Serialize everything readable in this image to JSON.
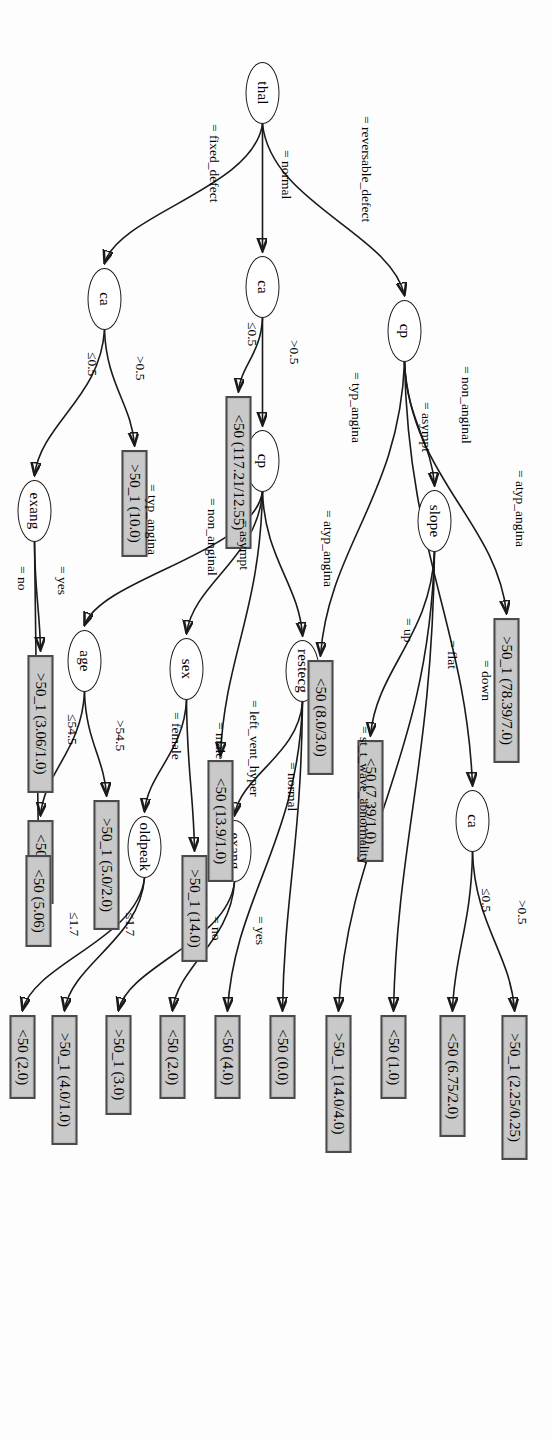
{
  "figure": {
    "kind": "decision-tree",
    "domain": "heart-disease (Cleveland) J48 / C4.5 pruned tree",
    "orientation": "rotated-90-clockwise",
    "root": "thal",
    "leaf_class_labels": [
      "<50",
      ">50_1"
    ]
  },
  "nodes": [
    {
      "id": "thal",
      "label": "thal",
      "type": "decision",
      "x": 62,
      "y": 272
    },
    {
      "id": "cp_top",
      "label": "cp",
      "type": "decision",
      "x": 300,
      "y": 130
    },
    {
      "id": "ca_mid",
      "label": "ca",
      "type": "decision",
      "x": 256,
      "y": 272
    },
    {
      "id": "ca_bot",
      "label": "ca",
      "type": "decision",
      "x": 268,
      "y": 430
    },
    {
      "id": "slope",
      "label": "slope",
      "type": "decision",
      "x": 490,
      "y": 100
    },
    {
      "id": "ca_top",
      "label": "ca",
      "type": "decision",
      "x": 790,
      "y": 62
    },
    {
      "id": "cp_mid",
      "label": "cp",
      "type": "decision",
      "x": 430,
      "y": 272
    },
    {
      "id": "restecg",
      "label": "restecg",
      "type": "decision",
      "x": 640,
      "y": 232
    },
    {
      "id": "exang_mid",
      "label": "exang",
      "type": "decision",
      "x": 820,
      "y": 300
    },
    {
      "id": "sex",
      "label": "sex",
      "type": "decision",
      "x": 638,
      "y": 348
    },
    {
      "id": "oldpeak",
      "label": "oldpeak",
      "type": "decision",
      "x": 816,
      "y": 390
    },
    {
      "id": "age",
      "label": "age",
      "type": "decision",
      "x": 630,
      "y": 450
    },
    {
      "id": "exang_bot",
      "label": "exang",
      "type": "decision",
      "x": 480,
      "y": 500
    }
  ],
  "leaves": [
    {
      "id": "L_ca_top_gt",
      "label": ">50_1 (2.25/0.25)",
      "x": 1015,
      "y": 24
    },
    {
      "id": "L_ca_top_le",
      "label": "<50 (6.75/2.0)",
      "x": 1015,
      "y": 86
    },
    {
      "id": "L_slope_down",
      "label": "<50 (1.0)",
      "x": 1015,
      "y": 145
    },
    {
      "id": "L_slope_flat",
      "label": ">50_1 (14.0/4.0)",
      "x": 1015,
      "y": 200
    },
    {
      "id": "L_slope_up",
      "label": "<50 (7.39/1.0)",
      "x": 740,
      "y": 168
    },
    {
      "id": "L_cp_asympt",
      "label": ">50_1 (78.39/7.0)",
      "x": 618,
      "y": 32
    },
    {
      "id": "L_cp_typ",
      "label": "<50 (8.0/3.0)",
      "x": 660,
      "y": 218
    },
    {
      "id": "L_rest_stt",
      "label": "<50 (0.0)",
      "x": 1015,
      "y": 256
    },
    {
      "id": "L_rest_norm",
      "label": "<50 (4.0)",
      "x": 1015,
      "y": 311
    },
    {
      "id": "L_exm_yes",
      "label": "<50 (2.0)",
      "x": 1015,
      "y": 366
    },
    {
      "id": "L_exm_no",
      "label": ">50_1 (3.0)",
      "x": 1015,
      "y": 420
    },
    {
      "id": "L_cpm_asym",
      "label": "<50 (13.9/1.0)",
      "x": 760,
      "y": 318
    },
    {
      "id": "L_sex_male",
      "label": ">50_1 (14.0)",
      "x": 855,
      "y": 344
    },
    {
      "id": "L_old_le",
      "label": ">50_1 (4.0/1.0)",
      "x": 1015,
      "y": 474
    },
    {
      "id": "L_old_gt",
      "label": "<50 (2.0)",
      "x": 1015,
      "y": 516
    },
    {
      "id": "L_ca_bot_gt",
      "label": ">50_1 (10.0)",
      "x": 450,
      "y": 404
    },
    {
      "id": "L_age_gt",
      "label": ">50_1 (5.0/2.0)",
      "x": 800,
      "y": 432
    },
    {
      "id": "L_age_le",
      "label": "<50 (2.0)",
      "x": 820,
      "y": 498
    },
    {
      "id": "L_exb_yes",
      "label": ">50_1 (3.06/1.0)",
      "x": 655,
      "y": 498
    },
    {
      "id": "L_exb_no",
      "label": "<50 (5.06)",
      "x": 855,
      "y": 500
    }
  ],
  "edges": [
    {
      "id": "e1",
      "from": "thal",
      "to": "cp_top",
      "label": "= reversable_defect",
      "lx": 116,
      "ly": 178
    },
    {
      "id": "e2",
      "from": "thal",
      "to": "ca_mid",
      "label": "= normal",
      "lx": 150,
      "ly": 258
    },
    {
      "id": "e3",
      "from": "thal",
      "to": "ca_bot",
      "label": "= fixed_defect",
      "lx": 124,
      "ly": 330
    },
    {
      "id": "e4",
      "from": "cp_top",
      "to": "L_cp_typ",
      "label": "= typ_angina",
      "lx": 372,
      "ly": 188
    },
    {
      "id": "e5",
      "from": "cp_top",
      "to": "L_cp_asympt",
      "label": "= asympt",
      "lx": 402,
      "ly": 118
    },
    {
      "id": "e6",
      "from": "cp_top",
      "to": "slope",
      "label": "= non_anginal",
      "lx": 366,
      "ly": 78
    },
    {
      "id": "e7",
      "from": "cp_top",
      "to": "ca_top",
      "label": "= atyp_angina",
      "lx": 470,
      "ly": 24
    },
    {
      "id": "e8",
      "from": "slope",
      "to": "L_slope_up",
      "label": "= up",
      "lx": 618,
      "ly": 136
    },
    {
      "id": "e9",
      "from": "slope",
      "to": "L_slope_flat",
      "label": "= flat",
      "lx": 640,
      "ly": 92
    },
    {
      "id": "e10",
      "from": "slope",
      "to": "L_slope_down",
      "label": "= down",
      "lx": 660,
      "ly": 58
    },
    {
      "id": "e11",
      "from": "ca_top",
      "to": "L_ca_top_le",
      "label": "≤0.5",
      "lx": 888,
      "ly": 58
    },
    {
      "id": "e12",
      "from": "ca_top",
      "to": "L_ca_top_gt",
      "label": ">0.5",
      "lx": 900,
      "ly": 22
    },
    {
      "id": "e13",
      "from": "ca_mid",
      "to": "L_mid_le",
      "label": "≤0.5",
      "lx": 322,
      "ly": 292
    },
    {
      "id": "e14",
      "from": "ca_mid",
      "to": "cp_mid",
      "label": ">0.5",
      "lx": 340,
      "ly": 250
    },
    {
      "id": "e15",
      "from": "cp_mid",
      "to": "age",
      "label": "= typ_angina",
      "lx": 484,
      "ly": 392
    },
    {
      "id": "e16",
      "from": "cp_mid",
      "to": "L_cpm_asym",
      "label": "= asympt",
      "lx": 520,
      "ly": 300
    },
    {
      "id": "e17",
      "from": "cp_mid",
      "to": "sex",
      "label": "= non_anginal",
      "lx": 498,
      "ly": 332
    },
    {
      "id": "e18",
      "from": "cp_mid",
      "to": "restecg",
      "label": "= atyp_angina",
      "lx": 510,
      "ly": 216
    },
    {
      "id": "e19",
      "from": "restecg",
      "to": "L_rest_stt",
      "label": "= st_t_wave_abnormality",
      "lx": 726,
      "ly": 180
    },
    {
      "id": "e20",
      "from": "restecg",
      "to": "L_rest_norm",
      "label": "= normal",
      "lx": 762,
      "ly": 252
    },
    {
      "id": "e21",
      "from": "restecg",
      "to": "exang_mid",
      "label": "= left_vent_hyper",
      "lx": 700,
      "ly": 290
    },
    {
      "id": "e22",
      "from": "exang_mid",
      "to": "L_exm_yes",
      "label": "= yes",
      "lx": 916,
      "ly": 284
    },
    {
      "id": "e23",
      "from": "exang_mid",
      "to": "L_exm_no",
      "label": "= no",
      "lx": 916,
      "ly": 328
    },
    {
      "id": "e24",
      "from": "sex",
      "to": "L_sex_male",
      "label": "= male",
      "lx": 722,
      "ly": 324
    },
    {
      "id": "e25",
      "from": "sex",
      "to": "oldpeak",
      "label": "= female",
      "lx": 712,
      "ly": 368
    },
    {
      "id": "e26",
      "from": "oldpeak",
      "to": "L_old_le",
      "label": "≤1.7",
      "lx": 912,
      "ly": 414
    },
    {
      "id": "e27",
      "from": "oldpeak",
      "to": "L_old_gt",
      "label": "≤1.7",
      "lx": 912,
      "ly": 470
    },
    {
      "id": "e28",
      "from": "age",
      "to": "L_age_gt",
      "label": ">54.5",
      "lx": 720,
      "ly": 424
    },
    {
      "id": "e29",
      "from": "age",
      "to": "L_age_le",
      "label": "≤54.5",
      "lx": 714,
      "ly": 472
    },
    {
      "id": "e30",
      "from": "ca_bot",
      "to": "L_ca_bot_gt",
      "label": ">0.5",
      "lx": 356,
      "ly": 404
    },
    {
      "id": "e31",
      "from": "ca_bot",
      "to": "exang_bot",
      "label": "≤0.5",
      "lx": 352,
      "ly": 452
    },
    {
      "id": "e32",
      "from": "exang_bot",
      "to": "L_exb_yes",
      "label": "= yes",
      "lx": 566,
      "ly": 482
    },
    {
      "id": "e33",
      "from": "exang_bot",
      "to": "L_exb_no",
      "label": "= no",
      "lx": 566,
      "ly": 522
    }
  ],
  "special_leaves": [
    {
      "id": "L_mid_le",
      "label": "<50 (117.21/12.55)",
      "x": 396,
      "y": 300
    }
  ],
  "colors": {
    "leaf_fill": "#c9c9c9",
    "leaf_border": "#4a4a4a",
    "node_border": "#1a1a1a",
    "edge": "#1a1a1a",
    "text": "#000000",
    "page": "#fdfdfd"
  }
}
